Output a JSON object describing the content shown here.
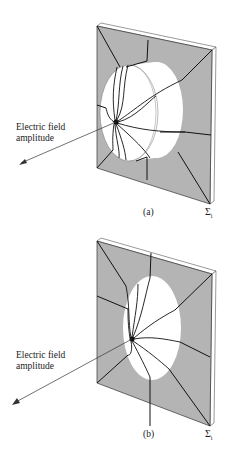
{
  "figure": {
    "panels": [
      {
        "id": "a",
        "caption": "(a)",
        "arrow_label_line1": "Electric field",
        "arrow_label_line2": "amplitude",
        "surface_label": "Σ",
        "surface_subscript": "i",
        "aperture_shape": "protruding cylinder (field extended out of the aperture plane)"
      },
      {
        "id": "b",
        "caption": "(b)",
        "arrow_label_line1": "Electric field",
        "arrow_label_line2": "amplitude",
        "surface_label": "Σ",
        "surface_subscript": "i",
        "aperture_shape": "flat elliptical opening"
      }
    ],
    "colors": {
      "screen_face": "#b4b4b4",
      "screen_edge": "#ffffff",
      "lines": "#111111",
      "aperture": "#ffffff"
    }
  }
}
